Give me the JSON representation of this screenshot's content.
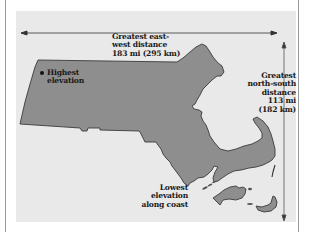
{
  "map": {
    "region": "Massachusetts",
    "colors": {
      "page_background": "#ffffff",
      "panel_background": "#e9e9e9",
      "land_fill": "#8e8e8e",
      "outline": "#3a3a3a",
      "frame_border": "#9a9a9a"
    },
    "labels": {
      "east_west": {
        "line1": "Greatest east-",
        "line2": "west distance",
        "line3": "183 mi (295 km)"
      },
      "highest": {
        "line1": "Highest",
        "line2": "elevation"
      },
      "north_south": {
        "line1": "Greatest",
        "line2": "north-south",
        "line3": "distance",
        "line4": "113 mi",
        "line5": "(182 km)"
      },
      "lowest": {
        "line1": "Lowest",
        "line2": "elevation",
        "line3": "along coast"
      }
    },
    "markers": {
      "highest_elevation_marker": "dot-icon"
    },
    "arrows": {
      "east_west_arrow": "double-headed horizontal arrow",
      "north_south_arrow": "double-headed vertical arrow"
    }
  }
}
